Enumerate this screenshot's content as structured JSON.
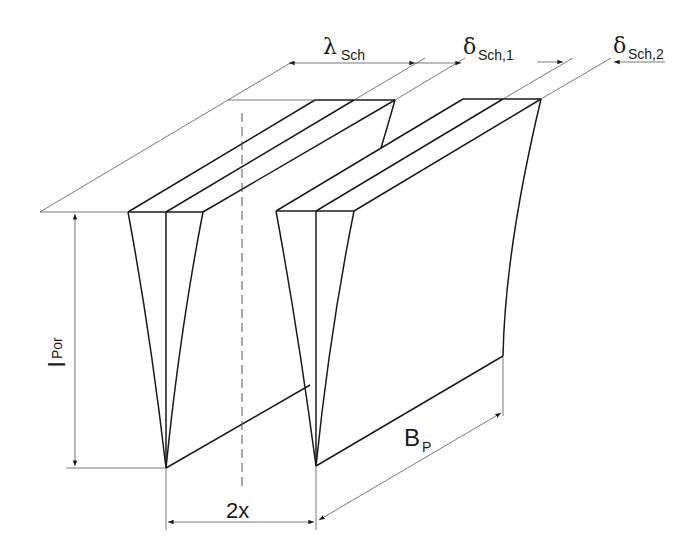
{
  "diagram": {
    "type": "technical-drawing",
    "labels": {
      "lambda_sym": "λ",
      "lambda_sub": "Sch",
      "delta1_sym": "δ",
      "delta1_sub": "Sch,1",
      "delta2_sym": "δ",
      "delta2_sub": "Sch,2",
      "lpor_sym": "l",
      "lpor_sub": "Por",
      "twox": "2x",
      "bp_sym": "B",
      "bp_sub": "P"
    },
    "dimensions": [
      {
        "name": "lambda_Sch",
        "meaning": "spacing between fin tops"
      },
      {
        "name": "delta_Sch,1",
        "meaning": "fin half-thickness"
      },
      {
        "name": "delta_Sch,2",
        "meaning": "fin half-thickness"
      },
      {
        "name": "l_Por",
        "meaning": "fin height"
      },
      {
        "name": "2x",
        "meaning": "gap at fin base"
      },
      {
        "name": "B_P",
        "meaning": "fin depth"
      }
    ],
    "colors": {
      "line": "#1a1a1a",
      "dimension": "#555555",
      "background": "#ffffff"
    }
  }
}
